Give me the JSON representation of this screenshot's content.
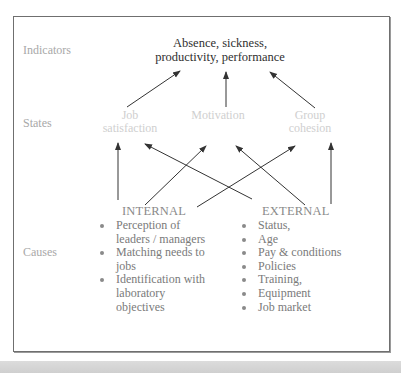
{
  "row_labels": {
    "indicators": "Indicators",
    "states": "States",
    "causes": "Causes"
  },
  "indicators": {
    "line1": "Absence, sickness,",
    "line2": "productivity, performance"
  },
  "states": [
    {
      "line1": "Job",
      "line2": "satisfaction"
    },
    {
      "line1": "Motivation",
      "line2": ""
    },
    {
      "line1": "Group",
      "line2": "cohesion"
    }
  ],
  "causes": {
    "internal": {
      "heading": "INTERNAL",
      "items": [
        "Perception of leaders / managers",
        "Matching needs to jobs",
        "Identification with laboratory objectives"
      ]
    },
    "external": {
      "heading": "EXTERNAL",
      "items": [
        "Status,",
        "Age",
        "Pay & conditions",
        "Policies",
        "Training,",
        "Equipment",
        "Job market"
      ]
    }
  },
  "arrows": [
    {
      "from": "Job satisfaction",
      "to": "Indicators"
    },
    {
      "from": "Motivation",
      "to": "Indicators"
    },
    {
      "from": "Group cohesion",
      "to": "Indicators"
    },
    {
      "from": "INTERNAL",
      "to": "Job satisfaction"
    },
    {
      "from": "INTERNAL",
      "to": "Motivation"
    },
    {
      "from": "INTERNAL",
      "to": "Group cohesion"
    },
    {
      "from": "EXTERNAL",
      "to": "Job satisfaction"
    },
    {
      "from": "EXTERNAL",
      "to": "Motivation"
    },
    {
      "from": "EXTERNAL",
      "to": "Group cohesion"
    }
  ],
  "colors": {
    "frame": "#6f6f6f",
    "arrow": "#333333",
    "state_text": "#cfcfcf",
    "label_text": "#a8a8a8"
  }
}
